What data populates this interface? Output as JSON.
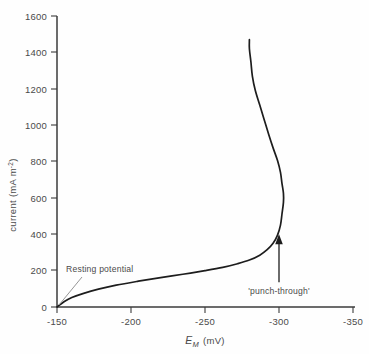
{
  "chart_data": {
    "type": "line",
    "title": "",
    "xlabel": "E_M (mV)",
    "ylabel": "current (mA m^-2)",
    "xlabel_parts": {
      "symbol": "E",
      "subscript": "M",
      "units": "(mV)"
    },
    "ylabel_parts": {
      "text": "current (mA m",
      "superscript": "-2",
      "close": ")"
    },
    "xlim": [
      -150,
      -350
    ],
    "ylim": [
      0,
      1600
    ],
    "x_ticks": [
      -150,
      -200,
      -250,
      -300,
      -350
    ],
    "x_tick_labels": [
      "-150",
      "-200",
      "-250",
      "-300",
      "-350"
    ],
    "y_ticks": [
      0,
      200,
      400,
      600,
      800,
      1000,
      1200,
      1400,
      1600
    ],
    "y_tick_labels": [
      "0",
      "200",
      "400",
      "600",
      "800",
      "1000",
      "1200",
      "1400",
      "1600"
    ],
    "grid": false,
    "legend": false,
    "x_axis_direction": "increasing-negative-rightward",
    "series": [
      {
        "name": "membrane current",
        "description": "N-shaped current-voltage characteristic with negative differential resistance region and punch-through",
        "points": [
          {
            "x": -150,
            "y": 0
          },
          {
            "x": -155,
            "y": 30
          },
          {
            "x": -160,
            "y": 52
          },
          {
            "x": -168,
            "y": 75
          },
          {
            "x": -178,
            "y": 98
          },
          {
            "x": -190,
            "y": 120
          },
          {
            "x": -205,
            "y": 142
          },
          {
            "x": -220,
            "y": 162
          },
          {
            "x": -235,
            "y": 180
          },
          {
            "x": -250,
            "y": 200
          },
          {
            "x": -262,
            "y": 218
          },
          {
            "x": -272,
            "y": 238
          },
          {
            "x": -280,
            "y": 258
          },
          {
            "x": -287,
            "y": 285
          },
          {
            "x": -292,
            "y": 315
          },
          {
            "x": -296,
            "y": 350
          },
          {
            "x": -299,
            "y": 395
          },
          {
            "x": -301,
            "y": 450
          },
          {
            "x": -302,
            "y": 510
          },
          {
            "x": -303,
            "y": 575
          },
          {
            "x": -303,
            "y": 625
          },
          {
            "x": -302,
            "y": 680
          },
          {
            "x": -301,
            "y": 740
          },
          {
            "x": -299,
            "y": 805
          },
          {
            "x": -296,
            "y": 875
          },
          {
            "x": -293,
            "y": 950
          },
          {
            "x": -290,
            "y": 1030
          },
          {
            "x": -287,
            "y": 1110
          },
          {
            "x": -284,
            "y": 1190
          },
          {
            "x": -282,
            "y": 1270
          },
          {
            "x": -281,
            "y": 1350
          },
          {
            "x": -280,
            "y": 1420
          },
          {
            "x": -280,
            "y": 1470
          }
        ],
        "peak_current": 625,
        "peak_voltage": -303
      }
    ],
    "annotations": [
      {
        "name": "resting-potential",
        "text": "Resting potential",
        "points_to_x": -150,
        "points_to_y": 0,
        "style": "leader-line"
      },
      {
        "name": "punch-through",
        "text": "'punch-through'",
        "points_to_x": -300,
        "points_to_y": 400,
        "style": "up-arrow"
      }
    ]
  }
}
